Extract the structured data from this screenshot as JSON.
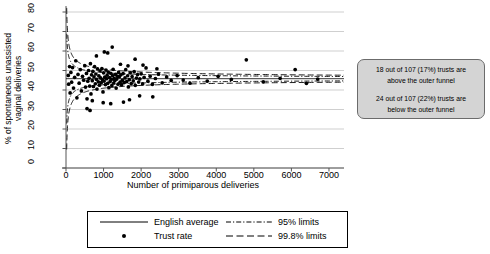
{
  "chart_data": {
    "type": "scatter",
    "title": "",
    "xlabel": "Number of primiparous deliveries",
    "ylabel_line1": "% of spontaneous unassisted",
    "ylabel_line2": "vaginal deliveries",
    "xlim": [
      0,
      7400
    ],
    "ylim": [
      0,
      80
    ],
    "xticks": [
      "0",
      "1000",
      "2000",
      "3000",
      "4000",
      "5000",
      "6000",
      "7000"
    ],
    "xtickvals": [
      0,
      1000,
      2000,
      3000,
      4000,
      5000,
      6000,
      7000
    ],
    "yticks": [
      "0",
      "10",
      "20",
      "30",
      "40",
      "50",
      "60",
      "70",
      "80"
    ],
    "ytickvals": [
      0,
      10,
      20,
      30,
      40,
      50,
      60,
      70,
      80
    ],
    "grid": "horizontal",
    "legend_position": "below-axes",
    "english_average": 45.8,
    "series": [
      {
        "name": "Trust rate",
        "type": "scatter",
        "marker": "filled-circle",
        "color": "#000000",
        "points": [
          [
            60,
            47.5
          ],
          [
            70,
            43.0
          ],
          [
            95,
            52.0
          ],
          [
            110,
            38.5
          ],
          [
            130,
            49.0
          ],
          [
            150,
            44.0
          ],
          [
            175,
            51.5
          ],
          [
            200,
            41.0
          ],
          [
            230,
            46.5
          ],
          [
            260,
            55.0
          ],
          [
            290,
            36.0
          ],
          [
            320,
            48.0
          ],
          [
            350,
            43.5
          ],
          [
            380,
            50.5
          ],
          [
            410,
            39.5
          ],
          [
            440,
            47.0
          ],
          [
            470,
            45.0
          ],
          [
            500,
            52.5
          ],
          [
            520,
            41.5
          ],
          [
            545,
            48.5
          ],
          [
            560,
            35.5
          ],
          [
            580,
            44.5
          ],
          [
            600,
            50.0
          ],
          [
            615,
            46.0
          ],
          [
            630,
            42.0
          ],
          [
            650,
            53.5
          ],
          [
            665,
            38.0
          ],
          [
            680,
            47.8
          ],
          [
            700,
            44.8
          ],
          [
            715,
            49.5
          ],
          [
            730,
            41.8
          ],
          [
            745,
            46.8
          ],
          [
            760,
            52.0
          ],
          [
            780,
            43.2
          ],
          [
            795,
            48.2
          ],
          [
            810,
            45.5
          ],
          [
            825,
            40.5
          ],
          [
            840,
            50.8
          ],
          [
            860,
            44.2
          ],
          [
            875,
            47.2
          ],
          [
            890,
            42.5
          ],
          [
            905,
            49.8
          ],
          [
            920,
            46.2
          ],
          [
            940,
            43.8
          ],
          [
            955,
            51.0
          ],
          [
            970,
            45.2
          ],
          [
            985,
            39.0
          ],
          [
            1000,
            48.8
          ],
          [
            1015,
            44.6
          ],
          [
            1030,
            46.6
          ],
          [
            1050,
            42.8
          ],
          [
            1065,
            50.2
          ],
          [
            1080,
            45.8
          ],
          [
            1095,
            47.6
          ],
          [
            1110,
            43.4
          ],
          [
            1125,
            49.2
          ],
          [
            1140,
            41.2
          ],
          [
            1160,
            46.4
          ],
          [
            1175,
            44.4
          ],
          [
            1190,
            48.6
          ],
          [
            1205,
            45.4
          ],
          [
            1220,
            42.2
          ],
          [
            1240,
            47.4
          ],
          [
            1255,
            50.6
          ],
          [
            1270,
            43.6
          ],
          [
            1285,
            46.0
          ],
          [
            1300,
            44.9
          ],
          [
            1320,
            48.0
          ],
          [
            1335,
            41.0
          ],
          [
            1350,
            45.6
          ],
          [
            1370,
            47.0
          ],
          [
            1385,
            43.0
          ],
          [
            1400,
            49.0
          ],
          [
            1420,
            46.8
          ],
          [
            1440,
            44.0
          ],
          [
            1460,
            47.8
          ],
          [
            1480,
            42.6
          ],
          [
            1500,
            45.0
          ],
          [
            1520,
            48.4
          ],
          [
            1545,
            43.8
          ],
          [
            1570,
            46.2
          ],
          [
            1590,
            50.4
          ],
          [
            1615,
            44.3
          ],
          [
            1640,
            47.3
          ],
          [
            1660,
            41.6
          ],
          [
            1685,
            45.3
          ],
          [
            1710,
            48.8
          ],
          [
            1735,
            43.3
          ],
          [
            1760,
            46.9
          ],
          [
            1790,
            44.7
          ],
          [
            1815,
            49.4
          ],
          [
            1845,
            42.4
          ],
          [
            1875,
            46.1
          ],
          [
            1905,
            47.9
          ],
          [
            1935,
            44.1
          ],
          [
            1965,
            45.7
          ],
          [
            2000,
            48.3
          ],
          [
            2040,
            43.1
          ],
          [
            2080,
            46.5
          ],
          [
            2130,
            51.3
          ],
          [
            2180,
            44.5
          ],
          [
            2240,
            47.1
          ],
          [
            2300,
            42.9
          ],
          [
            2380,
            45.9
          ],
          [
            2460,
            48.1
          ],
          [
            2560,
            43.7
          ],
          [
            2680,
            46.7
          ],
          [
            2800,
            44.9
          ],
          [
            2960,
            47.4
          ],
          [
            3120,
            45.1
          ],
          [
            3300,
            43.5
          ],
          [
            3520,
            46.3
          ],
          [
            3760,
            44.6
          ],
          [
            4050,
            47.0
          ],
          [
            4400,
            45.4
          ],
          [
            4800,
            55.5
          ],
          [
            5250,
            44.2
          ],
          [
            5700,
            46.0
          ],
          [
            6100,
            50.5
          ],
          [
            6400,
            43.4
          ],
          [
            6700,
            45.6
          ],
          [
            1230,
            62.0
          ],
          [
            1020,
            59.5
          ],
          [
            1110,
            59.0
          ],
          [
            810,
            57.5
          ],
          [
            1840,
            55.8
          ],
          [
            700,
            34.5
          ],
          [
            990,
            33.5
          ],
          [
            1190,
            33.0
          ],
          [
            1530,
            33.8
          ],
          [
            1690,
            35.0
          ],
          [
            2310,
            36.5
          ],
          [
            1960,
            37.0
          ],
          [
            560,
            30.5
          ],
          [
            640,
            29.5
          ],
          [
            2050,
            52.8
          ],
          [
            2420,
            50.9
          ],
          [
            1450,
            53.2
          ],
          [
            1650,
            52.4
          ]
        ]
      }
    ],
    "annotations": [
      "18 out of 107 (17%) trusts are above the outer funnel",
      "24 out of 107 (22%) trusts are below the outer funnel"
    ]
  },
  "annotation_box": {
    "line1": "18 out of 107 (17%) trusts are",
    "line2": "above the outer funnel",
    "line3": "24 out of 107 (22%) trusts are",
    "line4": "below the outer funnel",
    "background": "#d4d4d4",
    "border": "#6b6b6b"
  },
  "legend": {
    "items": [
      {
        "label": "English average",
        "style": "solid"
      },
      {
        "label": "Trust rate",
        "style": "dot"
      },
      {
        "label": "95% limits",
        "style": "dash-dot"
      },
      {
        "label": "99.8% limits",
        "style": "dashed"
      }
    ]
  }
}
